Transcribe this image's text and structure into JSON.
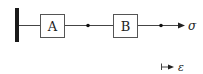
{
  "diagram": {
    "type": "series-element-model",
    "elements": [
      {
        "id": "A",
        "label": "A"
      },
      {
        "id": "B",
        "label": "B"
      }
    ],
    "output_symbol": "σ",
    "strain_symbol": "ε",
    "colors": {
      "stroke": "#333333",
      "wall": "#1a1a1a",
      "background": "#ffffff"
    }
  }
}
